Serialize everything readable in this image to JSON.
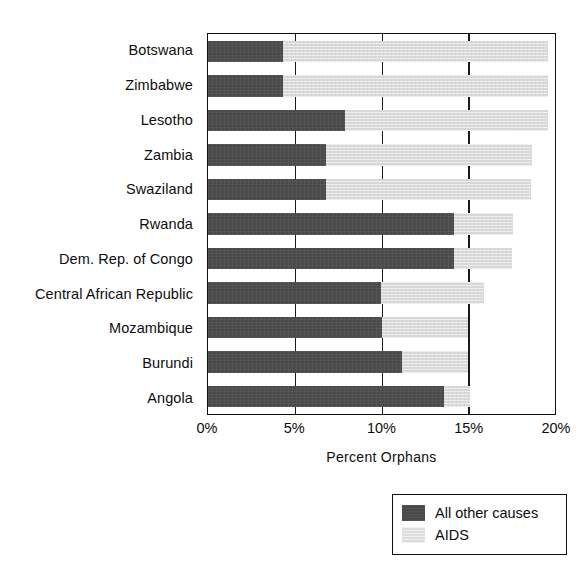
{
  "chart_data": {
    "type": "bar",
    "orientation": "horizontal",
    "stacked": true,
    "title": "",
    "xlabel": "Percent Orphans",
    "ylabel": "",
    "xlim": [
      0,
      20
    ],
    "xticks": [
      "0%",
      "5%",
      "10%",
      "15%",
      "20%"
    ],
    "xtick_values": [
      0,
      5,
      10,
      15,
      20
    ],
    "grid": true,
    "legend_position": "bottom-right",
    "categories": [
      "Botswana",
      "Zimbabwe",
      "Lesotho",
      "Zambia",
      "Swaziland",
      "Rwanda",
      "Dem. Rep. of Congo",
      "Central African Republic",
      "Mozambique",
      "Burundi",
      "Angola"
    ],
    "series": [
      {
        "name": "All other causes",
        "color": "#4a4a4a",
        "values": [
          4.3,
          4.3,
          7.9,
          6.8,
          6.8,
          14.2,
          14.2,
          10.0,
          10.0,
          11.2,
          13.6
        ]
      },
      {
        "name": "AIDS",
        "color": "#d9d9d9",
        "values": [
          15.3,
          15.3,
          11.7,
          11.9,
          11.8,
          3.4,
          3.3,
          5.9,
          5.0,
          3.8,
          1.5
        ]
      }
    ],
    "totals": [
      19.6,
      19.6,
      19.6,
      18.7,
      18.6,
      17.6,
      17.5,
      15.9,
      15.0,
      15.0,
      15.1
    ]
  },
  "legend": {
    "items": [
      {
        "label": "All other causes",
        "swatch": "dark-gray-swatch"
      },
      {
        "label": "AIDS",
        "swatch": "light-gray-swatch"
      }
    ]
  }
}
